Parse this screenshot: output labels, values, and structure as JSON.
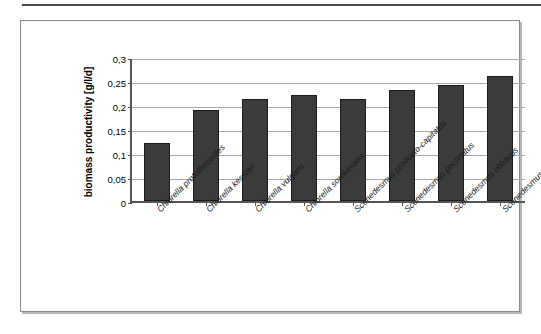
{
  "figure": {
    "background_color": "#ffffff",
    "frame_color": "#8a8a8a",
    "bar_color": "#3b3b3b",
    "gridline_color": "#aaaaaa",
    "axis_color": "#555555"
  },
  "chart_data": {
    "type": "bar",
    "title": "",
    "xlabel": "",
    "ylabel": "biomass productivity [g/l/d]",
    "ylim": [
      0,
      0.3
    ],
    "ytick_labels": [
      "0,3",
      "0,25",
      "0,2",
      "0,15",
      "0,1",
      "0,05",
      "0"
    ],
    "ytick_values": [
      0.3,
      0.25,
      0.2,
      0.15,
      0.1,
      0.05,
      0
    ],
    "grid": true,
    "legend": "none",
    "decimal_separator": ",",
    "categories": [
      "Chlorella protothecoides",
      "Chlorella kessleri",
      "Chlorella vulgaris",
      "Chlorella sorokiniana",
      "Scenedesmus producto-capitatus",
      "Scenedesmus pectinatus",
      "Scenedesmus obliquus",
      "Scenedesmus acuminatus"
    ],
    "values": [
      0.121,
      0.19,
      0.212,
      0.221,
      0.212,
      0.231,
      0.242,
      0.26
    ]
  }
}
